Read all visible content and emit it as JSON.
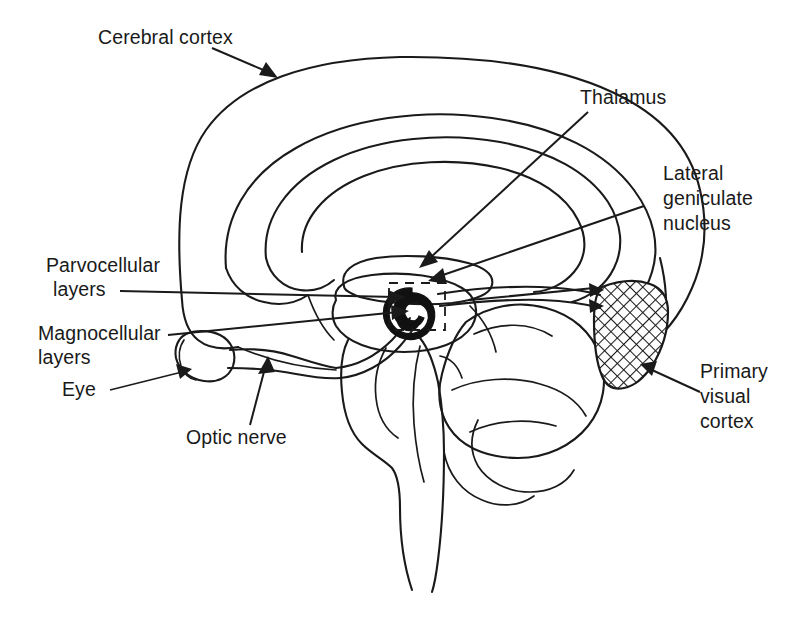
{
  "figure": {
    "background_color": "#ffffff",
    "ink_color": "#1a1a1a",
    "width": 807,
    "height": 627
  },
  "labels": {
    "cerebral_cortex": "Cerebral cortex",
    "thalamus": "Thalamus",
    "lateral_geniculate_line1": "Lateral",
    "lateral_geniculate_line2": "geniculate",
    "lateral_geniculate_line3": "nucleus",
    "parvocellular_line1": "Parvocellular",
    "parvocellular_line2": "layers",
    "magnocellular_line1": "Magnocellular",
    "magnocellular_line2": "layers",
    "eye": "Eye",
    "optic_nerve": "Optic nerve",
    "primary_visual_line1": "Primary",
    "primary_visual_line2": "visual",
    "primary_visual_line3": "cortex"
  },
  "structures": [
    {
      "name": "cerebral-cortex",
      "description": "Outer cortical outline of cerebral hemisphere"
    },
    {
      "name": "corpus-callosum",
      "description": "Concentric inner contours (corpus callosum and ventricle)"
    },
    {
      "name": "thalamus",
      "description": "Central oval mass above the lateral geniculate nucleus"
    },
    {
      "name": "lateral-geniculate-nucleus",
      "description": "Small dark spiral body with layered structure, enclosed in dashed detail box"
    },
    {
      "name": "optic-nerve",
      "description": "Nerve running from the eye backward to the optic chiasm"
    },
    {
      "name": "optic-radiation",
      "description": "Paired tract curving from the LGN back to the primary visual cortex"
    },
    {
      "name": "eye",
      "description": "Oval globe with lens at the anterior-inferior left"
    },
    {
      "name": "primary-visual-cortex",
      "description": "Crosshatched wedge at the occipital pole"
    },
    {
      "name": "cerebellum",
      "description": "Lobed structure posterior and inferior to the brainstem"
    },
    {
      "name": "brainstem",
      "description": "Midbrain, pons and medulla descending to the bottom of the figure"
    }
  ]
}
